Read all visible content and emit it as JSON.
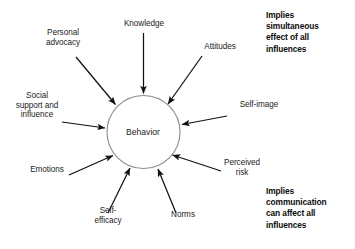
{
  "figure": {
    "center": {
      "label": "Behavior",
      "fill": "#ffffff",
      "stroke": "#8a8a8a"
    },
    "arrow_color": "#111111",
    "background": "#ffffff",
    "influences": [
      {
        "id": "personal-advocacy",
        "label": "Personal\nadvocacy"
      },
      {
        "id": "knowledge",
        "label": "Knowledge"
      },
      {
        "id": "attitudes",
        "label": "Attitudes"
      },
      {
        "id": "self-image",
        "label": "Self-image"
      },
      {
        "id": "perceived-risk",
        "label": "Perceived\nrisk"
      },
      {
        "id": "norms",
        "label": "Norms"
      },
      {
        "id": "self-efficacy",
        "label": "Self-\nefficacy"
      },
      {
        "id": "emotions",
        "label": "Emotions"
      },
      {
        "id": "social-support",
        "label": "Social\nsupport and\ninfluence"
      }
    ],
    "annotations": {
      "top": "Implies\nsimultaneous\neffect of all\ninfluences",
      "bottom": "Implies\ncommunication\ncan affect all\ninfluences"
    }
  }
}
